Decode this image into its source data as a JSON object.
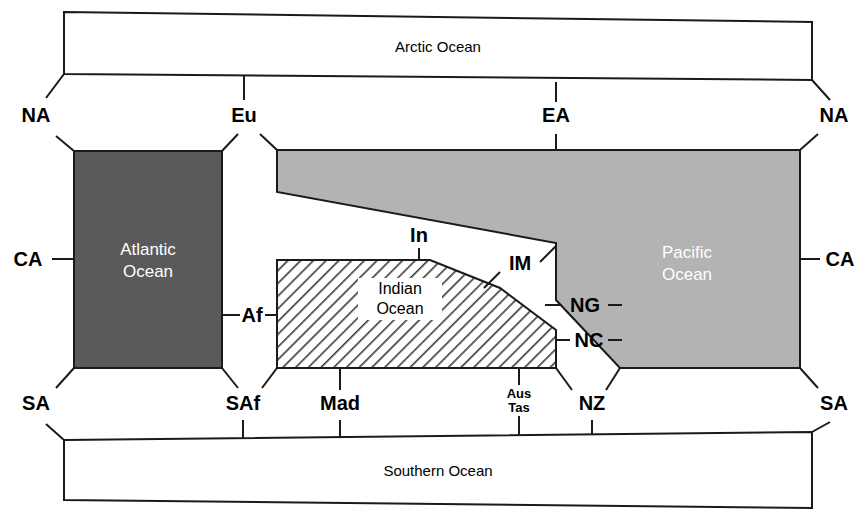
{
  "figure": {
    "type": "topological-connectivity-diagram"
  },
  "oceans": {
    "arctic": {
      "label": "Arctic Ocean",
      "fill": "#ffffff",
      "style": "open-box"
    },
    "atlantic": {
      "label_line1": "Atlantic",
      "label_line2": "Ocean",
      "fill": "#5a5a5a",
      "style": "dark-solid"
    },
    "pacific": {
      "label_line1": "Pacific",
      "label_line2": "Ocean",
      "fill": "#b3b3b3",
      "style": "light-solid"
    },
    "indian": {
      "label_line1": "Indian",
      "label_line2": "Ocean",
      "fill": "#ffffff",
      "style": "diagonal-hatch"
    },
    "southern": {
      "label": "Southern Ocean",
      "fill": "#ffffff",
      "style": "open-box"
    }
  },
  "margins": {
    "top_row": [
      {
        "code": "NA",
        "name": "north-america-left",
        "x": 36,
        "y": 122
      },
      {
        "code": "Eu",
        "name": "eurasia",
        "x": 244,
        "y": 122
      },
      {
        "code": "EA",
        "name": "east-asia",
        "x": 556,
        "y": 122
      },
      {
        "code": "NA",
        "name": "north-america-right",
        "x": 834,
        "y": 122
      }
    ],
    "bottom_row": [
      {
        "code": "SA",
        "name": "south-america-left",
        "x": 36,
        "y": 410
      },
      {
        "code": "SAf",
        "name": "south-africa",
        "x": 238,
        "y": 410
      },
      {
        "code": "Mad",
        "name": "madagascar",
        "x": 340,
        "y": 410
      },
      {
        "code": "Aus",
        "code2": "Tas",
        "name": "australia-tasmania",
        "x": 519,
        "y": 403
      },
      {
        "code": "NZ",
        "name": "new-zealand",
        "x": 592,
        "y": 410
      },
      {
        "code": "SA",
        "name": "south-america-right",
        "x": 834,
        "y": 410
      }
    ],
    "left_side": [
      {
        "code": "CA",
        "name": "central-america-left",
        "x": 30,
        "y": 265
      }
    ],
    "right_side": [
      {
        "code": "CA",
        "name": "central-america-right",
        "x": 836,
        "y": 265
      }
    ],
    "interior": [
      {
        "code": "Af",
        "name": "africa",
        "x": 252,
        "y": 315
      },
      {
        "code": "In",
        "name": "india",
        "x": 419,
        "y": 240
      },
      {
        "code": "IM",
        "name": "indo-malaysia",
        "x": 519,
        "y": 268
      },
      {
        "code": "NG",
        "name": "new-guinea",
        "x": 585,
        "y": 305
      },
      {
        "code": "NC",
        "name": "new-caledonia",
        "x": 588,
        "y": 340
      }
    ]
  },
  "colors": {
    "outline": "#1a1a1a",
    "atlantic_fill": "#5a5a5a",
    "pacific_fill": "#b3b3b3",
    "hatch_stroke": "#3a3a3a",
    "background": "#ffffff"
  }
}
